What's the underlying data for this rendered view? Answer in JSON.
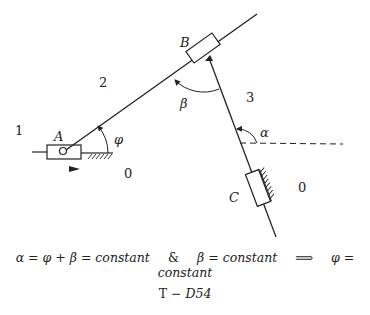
{
  "diagram": {
    "labels": {
      "A": "A",
      "B": "B",
      "C": "C",
      "link1": "1",
      "link2": "2",
      "link3": "3",
      "ground_left": "0",
      "ground_right": "0",
      "phi": "φ",
      "beta": "β",
      "alpha": "α"
    }
  },
  "equation": {
    "part1": "α = φ + β = constant",
    "and": "&",
    "part2": "β = constant",
    "implies": "⟹",
    "part3": "φ = constant"
  },
  "caption": {
    "prefix": "T − ",
    "id": "D54"
  }
}
